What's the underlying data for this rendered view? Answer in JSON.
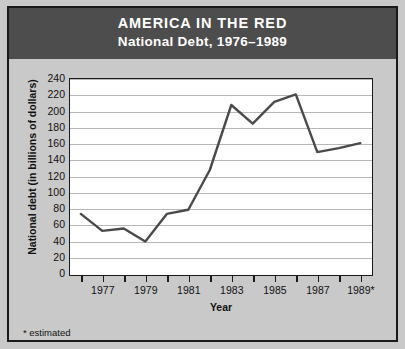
{
  "header": {
    "title": "AMERICA IN THE RED",
    "subtitle": "National Debt, 1976–1989"
  },
  "footnote": "* estimated",
  "colors": {
    "header_background": "#4d4d4d",
    "header_text": "#ffffff",
    "page_background": "#c9c9c9",
    "plot_background": "#ffffff",
    "gridline": "#b8b8b8",
    "axis": "#1a1a1a",
    "line": "#4a4a4a"
  },
  "chart_data": {
    "type": "line",
    "title": "AMERICA IN THE RED",
    "subtitle": "National Debt, 1976–1989",
    "xlabel": "Year",
    "ylabel": "National debt (in billions of dollars)",
    "x": [
      1976,
      1977,
      1978,
      1979,
      1980,
      1981,
      1982,
      1983,
      1984,
      1985,
      1986,
      1987,
      1988,
      1989
    ],
    "values": [
      74,
      53,
      56,
      40,
      74,
      79,
      128,
      208,
      185,
      212,
      221,
      150,
      155,
      161
    ],
    "xlim": [
      1975.5,
      1989.5
    ],
    "ylim": [
      0,
      240
    ],
    "yticks": [
      0,
      20,
      40,
      60,
      80,
      100,
      120,
      140,
      160,
      180,
      200,
      220,
      240
    ],
    "ytick_labels": [
      "0",
      "20",
      "40",
      "60",
      "80",
      "100",
      "120",
      "140",
      "160",
      "180",
      "200",
      "220",
      "240"
    ],
    "xtick_years": [
      1976,
      1977,
      1978,
      1979,
      1980,
      1981,
      1982,
      1983,
      1984,
      1985,
      1986,
      1987,
      1988,
      1989
    ],
    "xtick_labels": [
      {
        "year": 1977,
        "label": "1977"
      },
      {
        "year": 1979,
        "label": "1979"
      },
      {
        "year": 1981,
        "label": "1981"
      },
      {
        "year": 1983,
        "label": "1983"
      },
      {
        "year": 1985,
        "label": "1985"
      },
      {
        "year": 1987,
        "label": "1987"
      },
      {
        "year": 1989,
        "label": "1989*"
      }
    ],
    "grid": true,
    "legend": false,
    "annotations": [
      "* estimated"
    ]
  }
}
